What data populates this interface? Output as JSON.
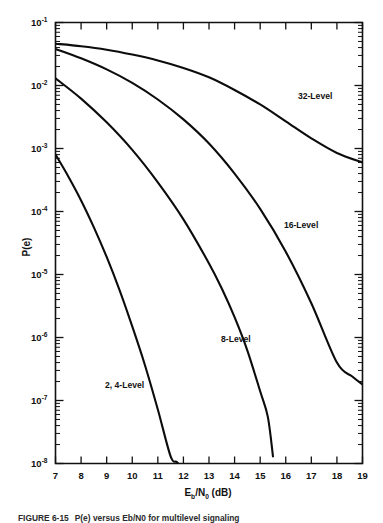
{
  "figure": {
    "caption_prefix": "FIGURE 6-15",
    "caption_text": "P(e) versus Eb/N0 for multilevel signaling",
    "background_color": "#ffffff",
    "ink_color": "#111111"
  },
  "axes": {
    "x_title_main": "E",
    "x_title_sub1": "b",
    "x_title_slash": "/N",
    "x_title_sub2": "0",
    "x_title_units": " (dB)",
    "x_title_full": "Eb/N0 (dB)",
    "y_title": "P(e)",
    "x_tick_labels": [
      "7",
      "8",
      "9",
      "10",
      "11",
      "12",
      "13",
      "14",
      "15",
      "16",
      "17",
      "18",
      "19"
    ],
    "y_tick_mantissa": "10",
    "y_tick_exponents": [
      "-1",
      "-2",
      "-3",
      "-4",
      "-5",
      "-6",
      "-7",
      "-8"
    ]
  },
  "chart_data": {
    "type": "line",
    "title": "",
    "xlabel": "Eb/N0 (dB)",
    "ylabel": "P(e)",
    "xlim": [
      7,
      19
    ],
    "ylim": [
      1e-08,
      0.1
    ],
    "yscale": "log",
    "xscale": "linear",
    "grid": false,
    "legend": "inline-annotations",
    "x_ticks": [
      7,
      8,
      9,
      10,
      11,
      12,
      13,
      14,
      15,
      16,
      17,
      18,
      19
    ],
    "y_ticks": [
      0.1,
      0.01,
      0.001,
      0.0001,
      1e-05,
      1e-06,
      1e-07,
      1e-08
    ],
    "series": [
      {
        "name": "2, 4-Level",
        "label": "2, 4-Level",
        "label_x": 9.7,
        "label_y": 1.6e-07,
        "x": [
          7.0,
          7.5,
          8.0,
          8.5,
          9.0,
          9.5,
          10.0,
          10.5,
          11.0,
          11.5,
          11.75,
          12.0
        ],
        "y": [
          0.0008,
          0.00036,
          0.00015,
          5.6e-05,
          1.9e-05,
          5.7e-06,
          1.5e-06,
          3.6e-07,
          7.2e-08,
          1.3e-08,
          1.05e-08,
          8e-09
        ]
      },
      {
        "name": "8-Level",
        "label": "8-Level",
        "label_x": 14.05,
        "label_y": 8.5e-07,
        "x": [
          7.0,
          8.0,
          9.0,
          10.0,
          11.0,
          12.0,
          13.0,
          13.5,
          14.0,
          14.5,
          15.0,
          15.3,
          15.5
        ],
        "y": [
          0.013,
          0.0062,
          0.0026,
          0.00095,
          0.00029,
          7.5e-05,
          1.5e-05,
          6e-06,
          2.1e-06,
          6.2e-07,
          1.4e-07,
          5.5e-08,
          1.3e-08
        ]
      },
      {
        "name": "16-Level",
        "label": "16-Level",
        "label_x": 16.6,
        "label_y": 5.4e-05,
        "x": [
          7.0,
          8.0,
          9.0,
          10.0,
          11.0,
          12.0,
          13.0,
          14.0,
          15.0,
          16.0,
          17.0,
          18.0,
          18.6,
          19.0
        ],
        "y": [
          0.038,
          0.027,
          0.018,
          0.011,
          0.006,
          0.0029,
          0.0012,
          0.0004,
          0.00011,
          2.3e-05,
          3.5e-06,
          4e-07,
          2.4e-07,
          1.8e-07
        ]
      },
      {
        "name": "32-Level",
        "label": "32-Level",
        "label_x": 17.15,
        "label_y": 0.0062,
        "x": [
          7.0,
          8.0,
          9.0,
          10.0,
          11.0,
          12.0,
          13.0,
          14.0,
          15.0,
          16.0,
          17.0,
          18.0,
          19.0
        ],
        "y": [
          0.046,
          0.042,
          0.037,
          0.031,
          0.025,
          0.019,
          0.0135,
          0.0085,
          0.005,
          0.0027,
          0.00145,
          0.00085,
          0.0006
        ]
      }
    ]
  }
}
